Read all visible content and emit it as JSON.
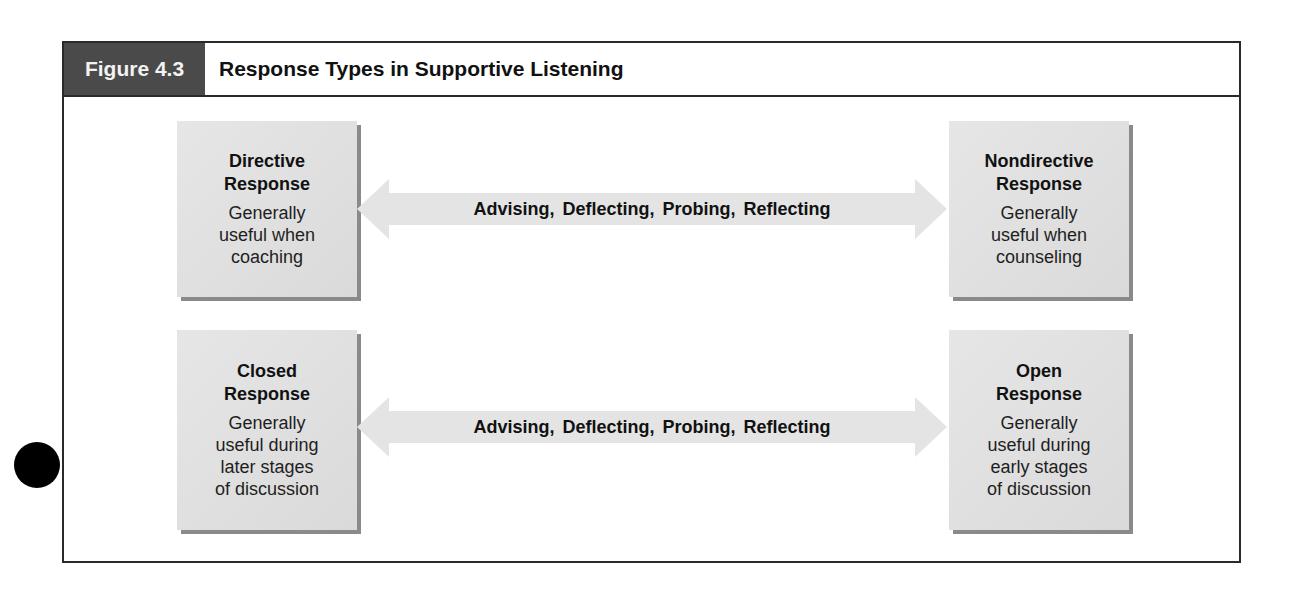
{
  "figure": {
    "number_label": "Figure 4.3",
    "title": "Response Types in Supportive Listening"
  },
  "colors": {
    "label_bg": "#4a4a4a",
    "box_fill": "#e0e0e0",
    "box_shadow": "#8a8a8a",
    "arrow_fill": "#e4e4e4",
    "frame_border": "#2a2a2a"
  },
  "rows": [
    {
      "left": {
        "title_line1": "Directive",
        "title_line2": "Response",
        "desc_line1": "Generally",
        "desc_line2": "useful when",
        "desc_line3": "coaching"
      },
      "arrow_label": "Advising, Deflecting, Probing, Reflecting",
      "right": {
        "title_line1": "Nondirective",
        "title_line2": "Response",
        "desc_line1": "Generally",
        "desc_line2": "useful when",
        "desc_line3": "counseling"
      }
    },
    {
      "left": {
        "title_line1": "Closed",
        "title_line2": "Response",
        "desc_line1": "Generally",
        "desc_line2": "useful during",
        "desc_line3": "later stages",
        "desc_line4": "of discussion"
      },
      "arrow_label": "Advising, Deflecting, Probing, Reflecting",
      "right": {
        "title_line1": "Open",
        "title_line2": "Response",
        "desc_line1": "Generally",
        "desc_line2": "useful during",
        "desc_line3": "early stages",
        "desc_line4": "of discussion"
      }
    }
  ]
}
